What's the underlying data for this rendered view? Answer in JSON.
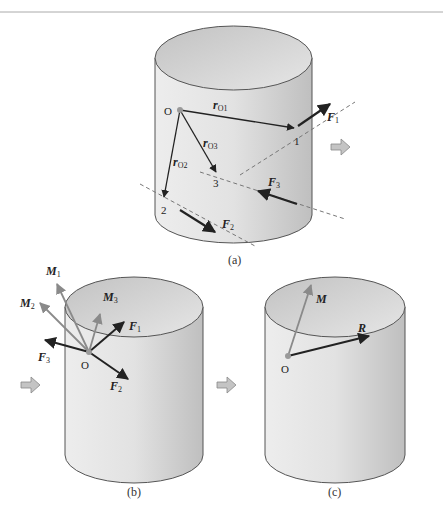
{
  "figure": {
    "panels": [
      {
        "caption": "(a)",
        "point_origin": "O",
        "points": [
          "1",
          "2",
          "3"
        ],
        "position_vectors": [
          {
            "label": "r",
            "sub": "O1"
          },
          {
            "label": "r",
            "sub": "O2"
          },
          {
            "label": "r",
            "sub": "O3"
          }
        ],
        "forces": [
          {
            "label": "F",
            "sub": "1"
          },
          {
            "label": "F",
            "sub": "2"
          },
          {
            "label": "F",
            "sub": "3"
          }
        ]
      },
      {
        "caption": "(b)",
        "point_origin": "O",
        "forces": [
          {
            "label": "F",
            "sub": "1"
          },
          {
            "label": "F",
            "sub": "2"
          },
          {
            "label": "F",
            "sub": "3"
          }
        ],
        "moments": [
          {
            "label": "M",
            "sub": "1"
          },
          {
            "label": "M",
            "sub": "2"
          },
          {
            "label": "M",
            "sub": "3"
          }
        ]
      },
      {
        "caption": "(c)",
        "point_origin": "O",
        "resultant_force": "R",
        "resultant_moment": "M"
      }
    ],
    "colors": {
      "force_arrow": "#222222",
      "moment_arrow": "#8a8a8a",
      "cylinder_outline": "#555555",
      "cylinder_fill_light": "#f2f2f2",
      "cylinder_fill_dark": "#c8c8c8",
      "transition_arrow": "#bdbdbd"
    }
  }
}
